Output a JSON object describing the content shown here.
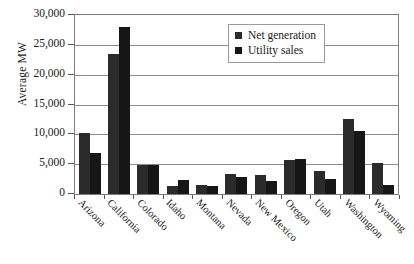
{
  "chart_data": {
    "type": "bar",
    "title": "",
    "xlabel": "",
    "ylabel": "Average MW",
    "ylim": [
      0,
      30000
    ],
    "ytick_step": 5000,
    "ytick_labels": [
      "30,000",
      "25,000",
      "20,000",
      "15,000",
      "10,000",
      "5,000",
      "0"
    ],
    "ytick_values": [
      30000,
      25000,
      20000,
      15000,
      10000,
      5000,
      0
    ],
    "grid": true,
    "legend_position": "top-right",
    "categories": [
      "Arizona",
      "California",
      "Colorado",
      "Idaho",
      "Montana",
      "Nevada",
      "New Mexico",
      "Oregon",
      "Utah",
      "Washington",
      "Wyoming"
    ],
    "series": [
      {
        "name": "Net generation",
        "color": "#2b2b2b",
        "values": [
          10300,
          23500,
          4900,
          1400,
          1600,
          3400,
          3200,
          5700,
          3900,
          12500,
          5200
        ]
      },
      {
        "name": "Utility sales",
        "color": "#161616",
        "values": [
          6900,
          28000,
          4900,
          2400,
          1400,
          2900,
          2200,
          5900,
          2500,
          10600,
          1600
        ]
      }
    ]
  },
  "legend": {
    "items": [
      {
        "label": "Net generation"
      },
      {
        "label": "Utility sales"
      }
    ]
  }
}
